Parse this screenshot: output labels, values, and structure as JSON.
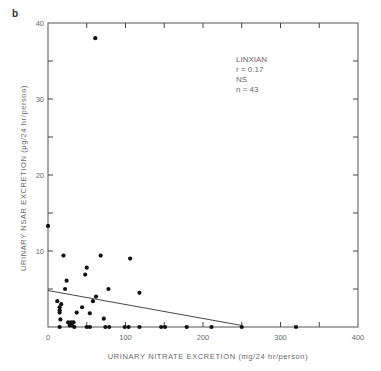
{
  "panel_label": "b",
  "annotation": {
    "lines": [
      "LINXIAN",
      "r = 0.17",
      "NS",
      "n = 43"
    ]
  },
  "chart_data": {
    "type": "scatter",
    "title": "",
    "xlabel": "URINARY NITRATE EXCRETION (mg/24 hr/person)",
    "ylabel": "URINARY NSAR EXCRETION (µg/24 hr/person)",
    "xlim": [
      0,
      400
    ],
    "ylim": [
      0,
      40
    ],
    "xticks": [
      0,
      100,
      200,
      300,
      400
    ],
    "yticks": [
      10,
      20,
      30,
      40
    ],
    "x_minor_ticks": [
      50,
      150,
      250,
      350
    ],
    "y_minor_ticks": [
      5,
      15,
      25,
      35
    ],
    "grid": false,
    "legend": null,
    "annotations": [
      "LINXIAN",
      "r = 0.17",
      "NS",
      "n = 43"
    ],
    "points": [
      {
        "x": 61,
        "y": 38
      },
      {
        "x": 0,
        "y": 13.3
      },
      {
        "x": 20,
        "y": 9.4
      },
      {
        "x": 68,
        "y": 9.4
      },
      {
        "x": 106,
        "y": 9
      },
      {
        "x": 50,
        "y": 7.8
      },
      {
        "x": 48,
        "y": 6.9
      },
      {
        "x": 24,
        "y": 6.1
      },
      {
        "x": 22,
        "y": 5
      },
      {
        "x": 78,
        "y": 5
      },
      {
        "x": 118,
        "y": 4.5
      },
      {
        "x": 62,
        "y": 4
      },
      {
        "x": 58,
        "y": 3.4
      },
      {
        "x": 12,
        "y": 3.4
      },
      {
        "x": 17,
        "y": 3
      },
      {
        "x": 15,
        "y": 2.6
      },
      {
        "x": 15,
        "y": 2.2
      },
      {
        "x": 15,
        "y": 1.9
      },
      {
        "x": 44,
        "y": 2.6
      },
      {
        "x": 37,
        "y": 1.9
      },
      {
        "x": 54,
        "y": 1.8
      },
      {
        "x": 16,
        "y": 1
      },
      {
        "x": 72,
        "y": 1.1
      },
      {
        "x": 26,
        "y": 0.6
      },
      {
        "x": 30,
        "y": 0.6
      },
      {
        "x": 33,
        "y": 0.6
      },
      {
        "x": 28,
        "y": 0.2
      },
      {
        "x": 31,
        "y": 0.2
      },
      {
        "x": 15,
        "y": 0
      },
      {
        "x": 34,
        "y": 0
      },
      {
        "x": 50,
        "y": 0
      },
      {
        "x": 54,
        "y": 0
      },
      {
        "x": 74,
        "y": 0
      },
      {
        "x": 79,
        "y": 0
      },
      {
        "x": 99,
        "y": 0
      },
      {
        "x": 104,
        "y": 0
      },
      {
        "x": 118,
        "y": 0
      },
      {
        "x": 146,
        "y": 0
      },
      {
        "x": 151,
        "y": 0
      },
      {
        "x": 179,
        "y": 0
      },
      {
        "x": 211,
        "y": 0
      },
      {
        "x": 250,
        "y": 0
      },
      {
        "x": 320,
        "y": 0
      }
    ],
    "regression_line": {
      "x1": 0,
      "y1": 4.8,
      "x2": 250,
      "y2": 0.2
    }
  }
}
